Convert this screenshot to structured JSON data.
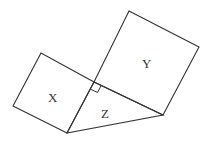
{
  "diagram": {
    "type": "geometry",
    "labels": {
      "x": "X",
      "y": "Y",
      "z": "Z"
    },
    "colors": {
      "stroke": "#333333",
      "text": "#333333",
      "background": "#ffffff"
    },
    "vertices": {
      "right_angle": [
        94,
        82
      ],
      "bottom": [
        67,
        133
      ],
      "right": [
        163,
        115
      ],
      "x_outer_left": [
        13,
        106
      ],
      "x_outer_top": [
        41,
        53
      ],
      "y_outer_right": [
        199,
        47
      ],
      "y_outer_top": [
        129,
        11
      ]
    }
  }
}
